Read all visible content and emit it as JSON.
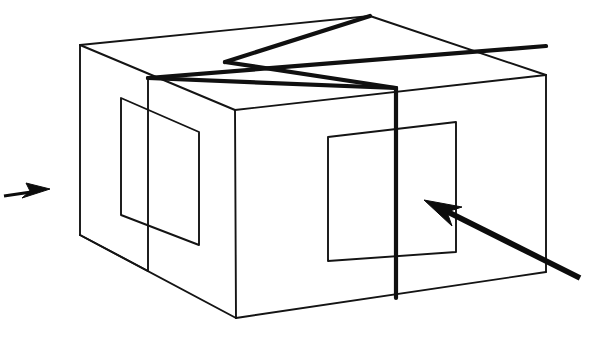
{
  "figure": {
    "title": "Perspective line drawing of a rectangular box divided into quadrants",
    "background_color": "#ffffff",
    "line_color": "#141414",
    "thick_line_color": "#101010",
    "arrow_color": "#0c0c0c",
    "canvas": {
      "width": 611,
      "height": 341
    }
  },
  "geometry": {
    "box": {
      "name": "rectangular-box",
      "vertices": {
        "top_back_left": [
          80,
          45
        ],
        "top_back_apex": [
          370,
          16
        ],
        "top_right_far": [
          546,
          75
        ],
        "top_front_mid": [
          235,
          110
        ],
        "top_front_right": [
          546,
          75
        ],
        "front_bottom_left": [
          236,
          318
        ],
        "front_bottom_right": [
          546,
          272
        ],
        "left_bottom_back": [
          80,
          235
        ],
        "left_edge_top": [
          80,
          45
        ],
        "left_inner_edge_x": 148
      },
      "top_face_outline": "80,45 370,16 546,75 235,110",
      "left_face_outline": "80,45 235,110 236,318 80,235",
      "front_face_outline": "235,110 546,75 546,272 236,318"
    },
    "divider_lines": [
      {
        "name": "top-divider-left-right",
        "points": "148,78 546,46"
      },
      {
        "name": "top-divider-front-back",
        "points": "225,97 396,88"
      },
      {
        "name": "front-face-thick-vertical",
        "points": "396,88 396,298"
      }
    ],
    "inset_panels": [
      {
        "name": "left-face-inset-panel",
        "points": "121,98 199,132 199,245 121,215"
      },
      {
        "name": "front-face-inset-panel",
        "points": "328,137 456,122 456,252 328,261"
      }
    ],
    "arrows": [
      {
        "name": "left-direction-arrow",
        "direction": "right",
        "tail": [
          4,
          196
        ],
        "tip": [
          50,
          190
        ]
      },
      {
        "name": "pointer-arrow-to-front-panel",
        "direction": "up-left",
        "tail": [
          580,
          278
        ],
        "tip": [
          424,
          200
        ]
      }
    ]
  }
}
